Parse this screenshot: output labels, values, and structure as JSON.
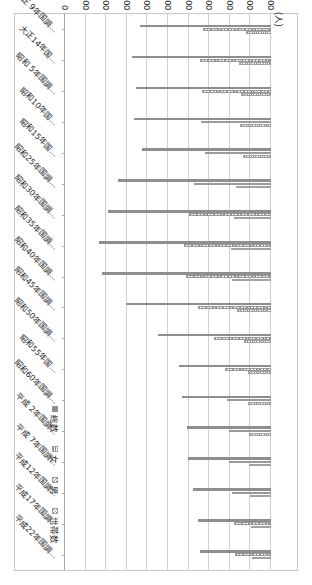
{
  "chart_data": {
    "type": "bar",
    "orientation": "horizontal",
    "title": "",
    "xlabel": "",
    "ylabel": "",
    "unit_label": "(人)",
    "xlim": [
      0,
      20000
    ],
    "grid": true,
    "legend_position": "bottom-right",
    "tick_labels": [
      "0",
      "2,000",
      "4,000",
      "6,000",
      "8,000",
      "10,000",
      "12,000",
      "14,000",
      "16,000",
      "18,000",
      "20,000"
    ],
    "tick_values": [
      0,
      2000,
      4000,
      6000,
      8000,
      10000,
      12000,
      14000,
      16000,
      18000,
      20000
    ],
    "categories": [
      "大正 9年国調…",
      "大正14年国…",
      "昭和 5年国調…",
      "昭和10年国…",
      "昭和15年国…",
      "昭和25年国調…",
      "昭和30年国調…",
      "昭和35年国調…",
      "昭和40年国調…",
      "昭和45年国調…",
      "昭和50年国調…",
      "昭和55年国…",
      "昭和60年国調…",
      "平成 2年国調…",
      "平成 7年国調…",
      "平成12年国調…",
      "平成17年国調…",
      "平成22年国調…"
    ],
    "series": [
      {
        "name": "総数",
        "pattern": "solid",
        "color": "#8e8e8e",
        "values": [
          12750,
          13500,
          13100,
          13300,
          12500,
          14900,
          15800,
          16700,
          16450,
          14100,
          11000,
          8900,
          8600,
          8200,
          8100,
          7600,
          7100,
          6900
        ]
      },
      {
        "name": "男",
        "pattern": "diagonal-hatch",
        "color": "#8e8e8e",
        "values": [
          6600,
          6900,
          6700,
          6800,
          6450,
          7500,
          7950,
          8400,
          8250,
          7050,
          5500,
          4450,
          4300,
          4100,
          4050,
          3800,
          3550,
          3450
        ]
      },
      {
        "name": "女",
        "pattern": "dotted-grid",
        "color": "#8e8e8e",
        "values": [
          2450,
          3100,
          2900,
          3000,
          2700,
          3350,
          3600,
          3900,
          3800,
          3300,
          2650,
          2250,
          2200,
          2150,
          2100,
          2000,
          1900,
          1850
        ]
      },
      {
        "name": "世帯数",
        "pattern": "back-diagonal-hatch",
        "color": "#9a9a9a",
        "values": [
          0,
          0,
          0,
          0,
          0,
          0,
          0,
          0,
          0,
          0,
          0,
          0,
          0,
          0,
          0,
          0,
          0,
          0
        ]
      }
    ]
  },
  "legend": {
    "items": [
      {
        "label": "総数",
        "pattern": "solid"
      },
      {
        "label": "女",
        "pattern": "dotted-grid"
      },
      {
        "label": "男",
        "pattern": "diagonal-hatch"
      },
      {
        "label": "世帯数",
        "pattern": "back-diagonal-hatch"
      }
    ]
  }
}
